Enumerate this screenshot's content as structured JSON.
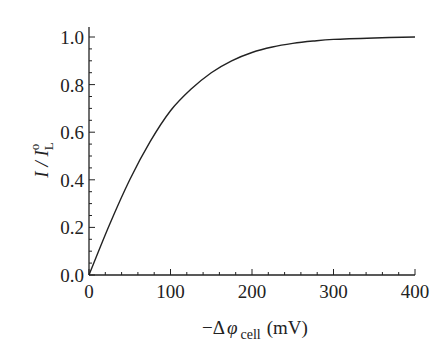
{
  "chart_data": {
    "type": "line",
    "title": "",
    "xlabel": "−Δφ_cell (mV)",
    "ylabel": "I / I_L^o",
    "xlim": [
      0,
      400
    ],
    "ylim": [
      0,
      1.0
    ],
    "x_ticks": [
      "0",
      "100",
      "200",
      "300",
      "400"
    ],
    "y_ticks": [
      "0.0",
      "0.2",
      "0.4",
      "0.6",
      "0.8",
      "1.0"
    ],
    "grid": false,
    "legend": null,
    "series": [
      {
        "name": "I / I_L^o",
        "x": [
          0,
          25,
          50,
          75,
          100,
          125,
          150,
          175,
          200,
          225,
          250,
          275,
          300,
          350,
          400
        ],
        "y": [
          0.0,
          0.21,
          0.4,
          0.56,
          0.69,
          0.78,
          0.85,
          0.9,
          0.935,
          0.958,
          0.973,
          0.983,
          0.99,
          0.996,
          1.0
        ]
      }
    ]
  },
  "labels": {
    "x_prefix": "−Δ",
    "x_phi": "φ",
    "x_sub": "cell",
    "x_unit": "(mV)",
    "y_main": "I / I",
    "y_sub": "L",
    "y_sup": "o"
  }
}
